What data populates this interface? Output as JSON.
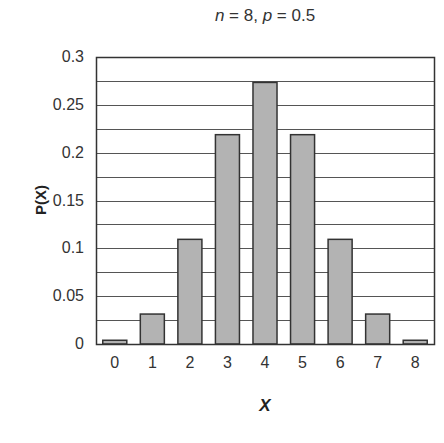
{
  "chart_data": {
    "type": "bar",
    "title": "n = 8, p = 0.5",
    "title_parts": {
      "n_var": "n",
      "n_eq": " = 8, ",
      "p_var": "p",
      "p_eq": " = 0.5"
    },
    "xlabel": "X",
    "ylabel": "P(X)",
    "categories": [
      "0",
      "1",
      "2",
      "3",
      "4",
      "5",
      "6",
      "7",
      "8"
    ],
    "values": [
      0.0039,
      0.0313,
      0.1094,
      0.2188,
      0.2734,
      0.2188,
      0.1094,
      0.0313,
      0.0039
    ],
    "ylim": [
      0,
      0.3
    ],
    "yticks": [
      "0",
      "0.05",
      "0.1",
      "0.15",
      "0.2",
      "0.25",
      "0.3"
    ],
    "ytick_values": [
      0,
      0.05,
      0.1,
      0.15,
      0.2,
      0.25,
      0.3
    ],
    "grid": true,
    "grid_step": 0.025,
    "legend": null,
    "colors": {
      "bar_fill": "#b3b3b3",
      "bar_stroke": "#333333",
      "grid": "#555555",
      "frame": "#333333"
    }
  }
}
